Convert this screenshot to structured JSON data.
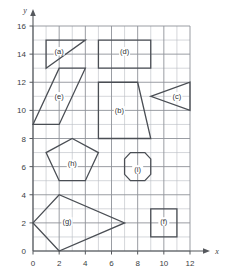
{
  "figure": {
    "axis_x_name": "x",
    "axis_y_name": "y",
    "x_ticks": [
      "0",
      "2",
      "4",
      "6",
      "8",
      "10",
      "12"
    ],
    "y_ticks": [
      "0",
      "2",
      "4",
      "6",
      "8",
      "10",
      "12",
      "14",
      "16"
    ],
    "grid": "on",
    "stroke_color": "#4a4e54",
    "grid_color": "#b9bcc2",
    "grid_major_color": "#8e9298"
  },
  "chart_data": {
    "type": "scatter",
    "title": "",
    "xlabel": "x",
    "ylabel": "y",
    "xlim": [
      0,
      12
    ],
    "ylim": [
      0,
      16
    ],
    "x_ticks": [
      0,
      2,
      4,
      6,
      8,
      10,
      12
    ],
    "y_ticks": [
      0,
      2,
      4,
      6,
      8,
      10,
      12,
      14,
      16
    ],
    "grid": true,
    "grid_spacing": 1,
    "legend": "none",
    "shapes": [
      {
        "label": "(a)",
        "kind": "triangle",
        "points": [
          [
            1,
            13
          ],
          [
            1,
            15
          ],
          [
            4,
            15
          ]
        ],
        "label_pos": [
          2.0,
          14.2
        ]
      },
      {
        "label": "(b)",
        "kind": "trapezoid",
        "points": [
          [
            5,
            8
          ],
          [
            5,
            12
          ],
          [
            8,
            12
          ],
          [
            9,
            8
          ]
        ],
        "label_pos": [
          6.6,
          10.0
        ]
      },
      {
        "label": "(c)",
        "kind": "triangle",
        "points": [
          [
            9,
            11
          ],
          [
            12,
            12
          ],
          [
            12,
            10
          ]
        ],
        "label_pos": [
          11.0,
          11.0
        ]
      },
      {
        "label": "(d)",
        "kind": "rectangle",
        "points": [
          [
            5,
            13
          ],
          [
            9,
            13
          ],
          [
            9,
            15
          ],
          [
            5,
            15
          ]
        ],
        "label_pos": [
          7.0,
          14.2
        ]
      },
      {
        "label": "(e)",
        "kind": "parallelogram",
        "points": [
          [
            0,
            9
          ],
          [
            2,
            13
          ],
          [
            4,
            13
          ],
          [
            2,
            9
          ]
        ],
        "label_pos": [
          2.0,
          11.0
        ]
      },
      {
        "label": "(f)",
        "kind": "square",
        "points": [
          [
            9,
            1
          ],
          [
            11,
            1
          ],
          [
            11,
            3
          ],
          [
            9,
            3
          ]
        ],
        "label_pos": [
          10.0,
          2.1
        ]
      },
      {
        "label": "(g)",
        "kind": "kite",
        "points": [
          [
            0,
            2
          ],
          [
            2,
            4
          ],
          [
            7,
            2
          ],
          [
            2,
            0
          ]
        ],
        "label_pos": [
          2.6,
          2.1
        ]
      },
      {
        "label": "(h)",
        "kind": "pentagon",
        "points": [
          [
            3,
            8
          ],
          [
            5,
            7
          ],
          [
            4,
            5
          ],
          [
            2,
            5
          ],
          [
            1,
            7
          ]
        ],
        "label_pos": [
          3.0,
          6.2
        ]
      },
      {
        "label": "(i)",
        "kind": "octagon",
        "points": [
          [
            7.45,
            7
          ],
          [
            8.55,
            7
          ],
          [
            9,
            6.55
          ],
          [
            9,
            5.45
          ],
          [
            8.55,
            5
          ],
          [
            7.45,
            5
          ],
          [
            7,
            5.45
          ],
          [
            7,
            6.55
          ]
        ],
        "label_pos": [
          8.0,
          5.8
        ]
      }
    ]
  }
}
